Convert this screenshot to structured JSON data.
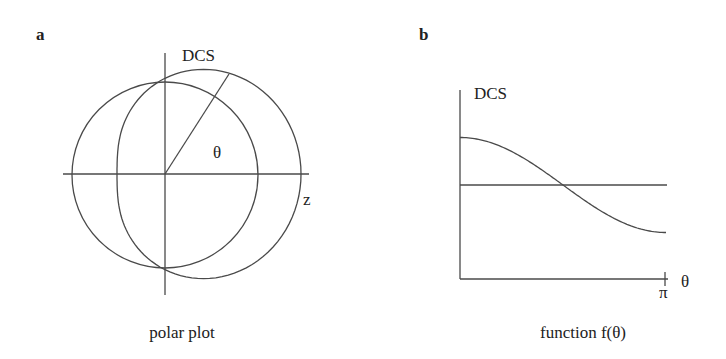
{
  "panels": [
    {
      "letter": "a",
      "caption": "polar plot",
      "vertical_label": "DCS",
      "horizontal_label": "z",
      "angle_label": "θ",
      "curves": [
        {
          "name": "isotropic",
          "type": "circle",
          "r": 92
        },
        {
          "name": "anisotropic",
          "type": "polar",
          "formula": "r = A + B cos θ",
          "A": 92,
          "B": 44
        }
      ]
    },
    {
      "letter": "b",
      "caption": "function f(θ)",
      "ylabel": "DCS",
      "xlabel": "θ",
      "x_end_tick": "π"
    }
  ],
  "chart_data": {
    "type": "line",
    "title": "function f(θ)",
    "xlabel": "θ",
    "ylabel": "DCS",
    "xlim": [
      0,
      3.1416
    ],
    "x_ticks": [
      "π"
    ],
    "series": [
      {
        "name": "isotropic (constant)",
        "x": [
          0,
          0.785,
          1.571,
          2.356,
          3.1416
        ],
        "values": [
          1.0,
          1.0,
          1.0,
          1.0,
          1.0
        ]
      },
      {
        "name": "anisotropic (1 + a cos θ)",
        "x": [
          0,
          0.785,
          1.571,
          2.356,
          3.1416
        ],
        "values": [
          1.5,
          1.35,
          1.0,
          0.65,
          0.5
        ]
      }
    ],
    "grid": false,
    "legend": "none"
  }
}
